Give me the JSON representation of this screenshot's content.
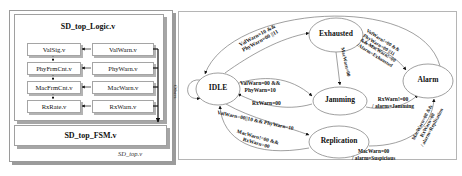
{
  "hierarchy": {
    "top_module": "SD_top.v",
    "logic_module": "SD_top_Logic.v",
    "fsm_module": "SD_top_FSM.v",
    "rows": [
      {
        "counter": "ValSig.v",
        "warn": "ValWarn.v"
      },
      {
        "counter": "PhyFrmCnt.v",
        "warn": "PhyWarn.v"
      },
      {
        "counter": "MacFrmCnt.v",
        "warn": "MacWarn.v"
      },
      {
        "counter": "RxRate.v",
        "warn": "RxWarn.v"
      }
    ]
  },
  "state_machine": {
    "states": {
      "idle": "IDLE",
      "exhausted": "Exhausted",
      "jamming": "Jamming",
      "replication": "Replication",
      "alarm": "Alarm"
    },
    "transitions": {
      "idle_self": "Others",
      "idle_to_exhausted_1": "ValWarn=10 &&",
      "idle_to_exhausted_2": "PhyWarn=00 ||11",
      "exhausted_to_jamming": "MacWarn=00",
      "exhausted_to_alarm_1": "ValWarn!=00 &&",
      "exhausted_to_alarm_2": "PhyWarn=00 ||11",
      "exhausted_to_alarm_3": "&& MacWarn!=00",
      "exhausted_to_alarm_4": "/Alarm=Exhausted",
      "idle_to_jamming_1": "ValWarn=00 &&",
      "idle_to_jamming_2": "PhyWarn=10",
      "jamming_to_idle": "RxWarn=00",
      "jamming_to_alarm_1": "RxWarn!=00",
      "jamming_to_alarm_2": "/ alarm=Jamming",
      "idle_to_replication": "ValWarn=00||10 && PhyWarn=10",
      "replication_to_idle_1": "MacWarn!=00 &&",
      "replication_to_idle_2": "RxWarn=00",
      "replication_to_alarm_a_1": "MacWarn=00",
      "replication_to_alarm_a_2": "/ alarm=Suspicious",
      "replication_to_alarm_b_1": "MacWarn=00 &&",
      "replication_to_alarm_b_2": "RxWarn=00",
      "replication_to_alarm_b_3": "/ alarm=Replication"
    }
  }
}
